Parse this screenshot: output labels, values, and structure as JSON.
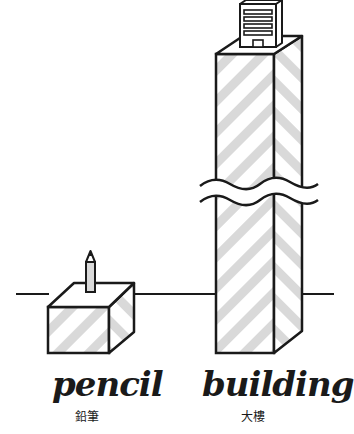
{
  "colors": {
    "stroke": "#1a1a1a",
    "stripe": "#d9d9d9",
    "background": "#ffffff"
  },
  "objects": [
    {
      "name": "pencil",
      "label_en": "pencil",
      "label_zh": "鉛筆"
    },
    {
      "name": "building",
      "label_en": "building",
      "label_zh": "大樓"
    }
  ],
  "annotations": {
    "break_symbol": "wavy-break-icon"
  }
}
